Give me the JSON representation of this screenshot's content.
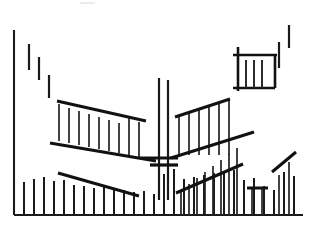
{
  "chart_data": {
    "type": "bar",
    "title": "",
    "subtitle": "",
    "xlabel": "",
    "ylabel": "",
    "grid": false,
    "legend": false,
    "legend_position": "none",
    "style": "monochrome line art",
    "xlim": [
      0,
      311
    ],
    "ylim": [
      232,
      0
    ],
    "axes": {
      "y_axis": {
        "x": 14,
        "y_top": 30,
        "y_bottom": 215
      },
      "x_axis": {
        "y": 215,
        "x_left": 14,
        "x_right": 303
      }
    },
    "series": [
      {
        "name": "baseline-ticks",
        "description": "row of short vertical tick bars rising from the x axis",
        "baseline_y": 215,
        "x": [
          24,
          34,
          44,
          54,
          64,
          74,
          84,
          94,
          104,
          114,
          124,
          134,
          144,
          154,
          164,
          174,
          184,
          194,
          204,
          214,
          224,
          234,
          244,
          254,
          264,
          274,
          284,
          294
        ],
        "top_y": [
          182,
          179,
          177,
          181,
          180,
          185,
          186,
          188,
          187,
          189,
          190,
          192,
          191,
          194,
          174,
          169,
          179,
          177,
          175,
          173,
          171,
          170,
          180,
          178,
          186,
          190,
          172,
          176
        ]
      },
      {
        "name": "descending-left-markers",
        "description": "three short vertical marks stepping down from upper left",
        "marks": [
          {
            "x": 29,
            "y_top": 44,
            "y_bottom": 70
          },
          {
            "x": 39,
            "y_top": 57,
            "y_bottom": 80
          },
          {
            "x": 49,
            "y_top": 75,
            "y_bottom": 98
          }
        ]
      },
      {
        "name": "ascending-right-markers",
        "description": "two short vertical marks stepping up to upper right",
        "marks": [
          {
            "x": 279,
            "y_top": 42,
            "y_bottom": 68
          },
          {
            "x": 289,
            "y_top": 25,
            "y_bottom": 48
          }
        ]
      },
      {
        "name": "left-wing-ribs",
        "description": "ribbed vertical bars inside the descending left wing of the V",
        "x": [
          59,
          69,
          79,
          89,
          99,
          109,
          119,
          129,
          139
        ],
        "top_y": [
          104,
          108,
          111,
          114,
          117,
          120,
          123,
          117,
          122
        ],
        "bottom_y": [
          141,
          143,
          145,
          147,
          149,
          151,
          153,
          155,
          157
        ]
      },
      {
        "name": "right-wing-ribs",
        "description": "ribbed vertical bars inside the ascending right wing of the V",
        "x": [
          179,
          189,
          199,
          209,
          219,
          229
        ],
        "top_y": [
          116,
          112,
          109,
          106,
          103,
          100
        ],
        "bottom_y": [
          155,
          155,
          155,
          155,
          155,
          155
        ]
      },
      {
        "name": "center-tall-bars",
        "description": "pair of tall vertical bars at the vertex of the V",
        "bars": [
          {
            "x": 159,
            "y_top": 78,
            "y_bottom": 200
          },
          {
            "x": 168,
            "y_top": 80,
            "y_bottom": 200
          }
        ]
      },
      {
        "name": "lower-right-ribs",
        "description": "ribbed bars under the ascending lower-right diagonal",
        "x": [
          181,
          189,
          197,
          205,
          213,
          221,
          229,
          237
        ],
        "top_y": [
          190,
          184,
          178,
          172,
          166,
          160,
          154,
          148
        ],
        "bottom_y": [
          215,
          215,
          215,
          215,
          215,
          215,
          215,
          215
        ]
      },
      {
        "name": "lower-right-small-group",
        "description": "small flat-topped group near the right baseline",
        "x": [
          252,
          262
        ],
        "top_y": [
          188,
          188
        ],
        "bottom_y": [
          215,
          215
        ]
      },
      {
        "name": "far-right-spike-bars",
        "description": "two bars under the far right diagonal",
        "x": [
          279,
          289
        ],
        "top_y": [
          175,
          162
        ],
        "bottom_y": [
          215,
          215
        ]
      }
    ],
    "envelopes": [
      {
        "name": "left-wing-upper",
        "x1": 57,
        "y1": 101,
        "x2": 146,
        "y2": 121
      },
      {
        "name": "left-wing-lower",
        "x1": 50,
        "y1": 143,
        "x2": 156,
        "y2": 161
      },
      {
        "name": "right-wing-upper",
        "x1": 175,
        "y1": 117,
        "x2": 230,
        "y2": 99
      },
      {
        "name": "right-wing-lower",
        "x1": 171,
        "y1": 158,
        "x2": 254,
        "y2": 132
      },
      {
        "name": "lower-left-descender",
        "x1": 58,
        "y1": 173,
        "x2": 139,
        "y2": 196
      },
      {
        "name": "lower-right-ascender",
        "x1": 176,
        "y1": 193,
        "x2": 243,
        "y2": 164
      },
      {
        "name": "far-right-ascender",
        "x1": 272,
        "y1": 172,
        "x2": 296,
        "y2": 152
      },
      {
        "name": "small-group-cap",
        "x1": 247,
        "y1": 188,
        "x2": 268,
        "y2": 188
      },
      {
        "name": "v-floor",
        "x1": 140,
        "y1": 158,
        "x2": 178,
        "y2": 158
      }
    ],
    "mid_marker": {
      "name": "center-crossbar",
      "description": "short bold horizontal bar crossing the tall center bars",
      "x1": 150,
      "x2": 178,
      "y": 165
    },
    "inset_box": {
      "name": "top-right-inset",
      "description": "small boxed grid of ribbed bars in the upper right",
      "left": 238,
      "right": 275,
      "top": 55,
      "bottom": 88,
      "overhang_left": 233,
      "overhang_right": 277,
      "rib_x": [
        246,
        254,
        262
      ],
      "rib_top": 60,
      "rib_bottom": 88
    },
    "colors": {
      "ink": "#1a1a1a",
      "background": "#ffffff",
      "faint": "#d8d8d8"
    }
  }
}
